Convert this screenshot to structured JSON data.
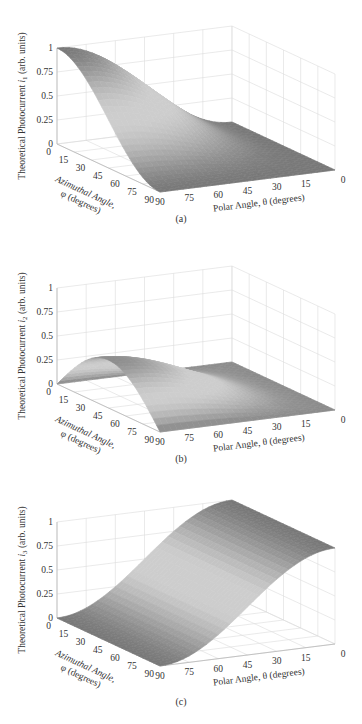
{
  "figure": {
    "panels": [
      {
        "id": "a",
        "caption": "(a)",
        "ylabel_prefix": "Theoretical Photocurrent ",
        "ylabel_var": "i",
        "ylabel_sub": "1",
        "ylabel_suffix": " (arb. units)"
      },
      {
        "id": "b",
        "caption": "(b)",
        "ylabel_prefix": "Theoretical Photocurrent ",
        "ylabel_var": "i",
        "ylabel_sub": "2",
        "ylabel_suffix": " (arb. units)"
      },
      {
        "id": "c",
        "caption": "(c)",
        "ylabel_prefix": "Theoretical Photocurrent ",
        "ylabel_var": "i",
        "ylabel_sub": "3",
        "ylabel_suffix": " (arb. units)"
      }
    ]
  },
  "chart_data": [
    {
      "type": "surface",
      "panel": "(a)",
      "title": "",
      "xlabel": "Polar Angle, θ (degrees)",
      "ylabel": "Azimuthal Angle, φ (degrees)",
      "zlabel": "Theoretical Photocurrent i1 (arb. units)",
      "x_ticks": [
        90,
        75,
        60,
        45,
        30,
        15,
        0
      ],
      "y_ticks": [
        0,
        15,
        30,
        45,
        60,
        75,
        90
      ],
      "z_ticks": [
        0,
        0.25,
        0.5,
        0.75,
        1
      ],
      "xlim": [
        0,
        90
      ],
      "ylim": [
        0,
        90
      ],
      "zlim": [
        0,
        1
      ],
      "grid": true,
      "description": "Surface high (~1) at theta=90 and phi=0, falling to 0 at theta=0 and at phi=90; i1 ≈ sin²θ·cos²φ",
      "theta": [
        0,
        15,
        30,
        45,
        60,
        75,
        90
      ],
      "phi": [
        0,
        15,
        30,
        45,
        60,
        75,
        90
      ],
      "z_at_phi0": [
        0.0,
        0.07,
        0.25,
        0.5,
        0.75,
        0.93,
        1.0
      ],
      "z_at_theta90": [
        1.0,
        0.93,
        0.75,
        0.5,
        0.25,
        0.07,
        0.0
      ]
    },
    {
      "type": "surface",
      "panel": "(b)",
      "title": "",
      "xlabel": "Polar Angle, θ (degrees)",
      "ylabel": "Azimuthal Angle, φ (degrees)",
      "zlabel": "Theoretical Photocurrent i2 (arb. units)",
      "x_ticks": [
        90,
        75,
        60,
        45,
        30,
        15,
        0
      ],
      "y_ticks": [
        0,
        15,
        30,
        45,
        60,
        75,
        90
      ],
      "z_ticks": [
        0,
        0.25,
        0.5,
        0.75,
        1
      ],
      "xlim": [
        0,
        90
      ],
      "ylim": [
        0,
        90
      ],
      "zlim": [
        0,
        1
      ],
      "grid": true,
      "description": "Surface peaks (~0.5) at theta=90, phi=45, zero at phi=0 and phi=90 and at theta=0; i2 ≈ sin²θ·sin(2φ)/2",
      "theta": [
        0,
        15,
        30,
        45,
        60,
        75,
        90
      ],
      "phi": [
        0,
        15,
        30,
        45,
        60,
        75,
        90
      ],
      "z_at_theta90": [
        0.0,
        0.25,
        0.43,
        0.5,
        0.43,
        0.25,
        0.0
      ],
      "z_at_phi45": [
        0.0,
        0.03,
        0.13,
        0.25,
        0.38,
        0.47,
        0.5
      ]
    },
    {
      "type": "surface",
      "panel": "(c)",
      "title": "",
      "xlabel": "Polar Angle, θ (degrees)",
      "ylabel": "Azimuthal Angle, φ (degrees)",
      "zlabel": "Theoretical Photocurrent i3 (arb. units)",
      "x_ticks": [
        90,
        75,
        60,
        45,
        30,
        15,
        0
      ],
      "y_ticks": [
        0,
        15,
        30,
        45,
        60,
        75,
        90
      ],
      "z_ticks": [
        0,
        0.25,
        0.5,
        0.75,
        1
      ],
      "xlim": [
        0,
        90
      ],
      "ylim": [
        0,
        90
      ],
      "zlim": [
        0,
        1
      ],
      "grid": true,
      "description": "Surface independent of phi; 0 at theta=90 rising to 1 at theta=0; i3 ≈ cos²θ",
      "theta": [
        0,
        15,
        30,
        45,
        60,
        75,
        90
      ],
      "z_vs_theta": [
        1.0,
        0.93,
        0.75,
        0.5,
        0.25,
        0.07,
        0.0
      ]
    }
  ],
  "axes_common": {
    "z_tick_labels": [
      "0",
      "0.25",
      "0.5",
      "0.75",
      "1"
    ],
    "phi_tick_labels": [
      "0",
      "15",
      "30",
      "45",
      "60",
      "75",
      "90"
    ],
    "theta_tick_labels": [
      "90",
      "75",
      "60",
      "45",
      "30",
      "15",
      "0"
    ],
    "phi_label_line1": "Azimuthal Angle,",
    "phi_label_line2": "φ (degrees)",
    "theta_label": "Polar Angle, θ (degrees)"
  }
}
